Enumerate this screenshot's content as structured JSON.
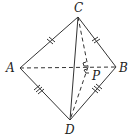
{
  "figure": {
    "type": "tetrahedron-diagram",
    "stroke_color": "#333333",
    "background": "#ffffff",
    "points": {
      "A": {
        "label": "A"
      },
      "B": {
        "label": "B"
      },
      "C": {
        "label": "C"
      },
      "D": {
        "label": "D"
      },
      "P": {
        "label": "P"
      }
    },
    "edges": {
      "solid": [
        "CA",
        "CB",
        "CD",
        "AD",
        "BD"
      ],
      "dashed": [
        "AB",
        "CP",
        "PD"
      ]
    },
    "marks": {
      "AC": "double-tick",
      "CB": "double-tick",
      "AD": "triple-tick",
      "BD": "triple-tick",
      "P": "right-angle"
    }
  }
}
